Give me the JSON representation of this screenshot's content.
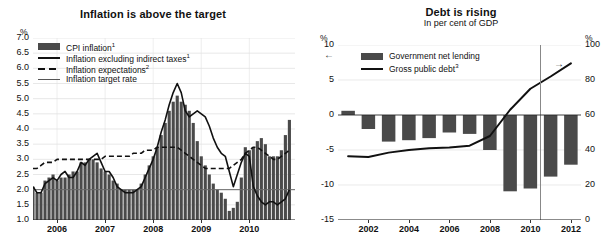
{
  "figure": {
    "background": "#ffffff",
    "bar_color": "#4a4a4a",
    "line_color": "#111111"
  },
  "left_panel": {
    "title": "Inflation is above the target",
    "y_unit": "%",
    "legend": [
      {
        "label": "CPI inflation",
        "sup": "1",
        "key": "swatch"
      },
      {
        "label": "Inflation excluding indirect taxes",
        "sup": "1",
        "key": "solid"
      },
      {
        "label": "Inflation expectations",
        "sup": "2",
        "key": "dash"
      },
      {
        "label": "Inflation target rate",
        "sup": "",
        "key": "thin"
      }
    ]
  },
  "right_panel": {
    "title": "Debt is rising",
    "subtitle": "In per cent of GDP",
    "y_unit_left": "%",
    "y_unit_right": "%",
    "arrow_left": "←",
    "arrow_right": "→",
    "legend": [
      {
        "label": "Government net lending",
        "sup": "",
        "key": "swatch"
      },
      {
        "label": "Gross public debt",
        "sup": "3",
        "key": "solid"
      }
    ]
  },
  "chart_data": [
    {
      "id": "inflation",
      "type": "bar",
      "title": "Inflation is above the target",
      "xlabel": "",
      "ylabel": "%",
      "ylim": [
        1.0,
        7.0
      ],
      "yticks": [
        "1.0",
        "1.5",
        "2.0",
        "2.5",
        "3.0",
        "3.5",
        "4.0",
        "4.5",
        "5.0",
        "5.5",
        "6.0",
        "6.5",
        "7.0"
      ],
      "xticks": [
        "2006",
        "2007",
        "2008",
        "2009",
        "2010"
      ],
      "xtick_positions": [
        2006.0,
        2007.0,
        2008.0,
        2009.0,
        2010.0
      ],
      "xlim": [
        2005.5,
        2010.95
      ],
      "grid": true,
      "legend_position": "top-left",
      "target_rate": 2.0,
      "categories": [
        "2005-07",
        "2005-08",
        "2005-09",
        "2005-10",
        "2005-11",
        "2005-12",
        "2006-01",
        "2006-02",
        "2006-03",
        "2006-04",
        "2006-05",
        "2006-06",
        "2006-07",
        "2006-08",
        "2006-09",
        "2006-10",
        "2006-11",
        "2006-12",
        "2007-01",
        "2007-02",
        "2007-03",
        "2007-04",
        "2007-05",
        "2007-06",
        "2007-07",
        "2007-08",
        "2007-09",
        "2007-10",
        "2007-11",
        "2007-12",
        "2008-01",
        "2008-02",
        "2008-03",
        "2008-04",
        "2008-05",
        "2008-06",
        "2008-07",
        "2008-08",
        "2008-09",
        "2008-10",
        "2008-11",
        "2008-12",
        "2009-01",
        "2009-02",
        "2009-03",
        "2009-04",
        "2009-05",
        "2009-06",
        "2009-07",
        "2009-08",
        "2009-09",
        "2009-10",
        "2009-11",
        "2009-12",
        "2010-01",
        "2010-02",
        "2010-03",
        "2010-04",
        "2010-05",
        "2010-06",
        "2010-07",
        "2010-08",
        "2010-09",
        "2010-10",
        "2010-11"
      ],
      "series": [
        {
          "name": "CPI inflation",
          "type": "bar",
          "values": [
            2.1,
            1.9,
            1.9,
            2.3,
            2.4,
            2.5,
            2.3,
            2.4,
            2.4,
            2.5,
            2.6,
            2.6,
            2.9,
            2.9,
            3.0,
            3.0,
            2.9,
            2.7,
            2.6,
            2.5,
            2.3,
            2.2,
            2.0,
            2.0,
            2.0,
            2.0,
            2.0,
            2.2,
            2.5,
            2.8,
            3.1,
            3.4,
            3.8,
            4.2,
            4.6,
            4.9,
            5.1,
            4.9,
            4.8,
            4.6,
            4.2,
            3.6,
            3.1,
            2.8,
            2.5,
            2.2,
            2.0,
            1.9,
            1.7,
            1.3,
            1.4,
            1.6,
            2.4,
            3.4,
            3.3,
            3.4,
            3.6,
            3.7,
            3.5,
            3.1,
            3.1,
            3.1,
            3.3,
            3.8,
            4.3
          ]
        },
        {
          "name": "Inflation excluding indirect taxes",
          "type": "line",
          "values": [
            2.1,
            1.9,
            1.9,
            2.2,
            2.3,
            2.4,
            2.3,
            2.5,
            2.6,
            2.4,
            2.4,
            2.6,
            2.9,
            2.8,
            3.0,
            3.1,
            3.2,
            2.9,
            2.6,
            2.6,
            2.4,
            2.1,
            2.0,
            1.9,
            1.9,
            1.9,
            2.0,
            2.1,
            2.4,
            2.7,
            3.0,
            3.4,
            3.9,
            4.3,
            4.8,
            5.2,
            5.5,
            5.2,
            4.6,
            4.4,
            4.5,
            4.6,
            4.5,
            4.4,
            4.1,
            3.7,
            3.4,
            3.2,
            3.1,
            2.6,
            2.1,
            2.5,
            2.9,
            3.2,
            3.1,
            2.1,
            1.8,
            1.6,
            1.5,
            1.6,
            1.6,
            1.5,
            1.6,
            1.7,
            2.0
          ]
        },
        {
          "name": "Inflation expectations",
          "type": "dashed-line",
          "values": [
            2.7,
            2.7,
            2.8,
            2.9,
            2.9,
            2.9,
            3.0,
            3.0,
            3.0,
            3.0,
            3.0,
            3.0,
            3.0,
            3.0,
            3.0,
            3.0,
            3.0,
            3.0,
            3.1,
            3.1,
            3.1,
            3.1,
            3.1,
            3.1,
            3.1,
            3.2,
            3.2,
            3.2,
            3.3,
            3.3,
            3.3,
            3.4,
            3.4,
            3.4,
            3.4,
            3.4,
            3.4,
            3.3,
            3.2,
            3.1,
            3.0,
            2.9,
            2.8,
            2.7,
            2.7,
            2.7,
            2.7,
            2.7,
            2.7,
            2.7,
            2.8,
            2.9,
            3.0,
            3.2,
            3.3,
            3.4,
            3.4,
            3.3,
            3.2,
            3.1,
            3.0,
            3.0,
            3.1,
            3.2,
            3.3
          ]
        }
      ]
    },
    {
      "id": "debt",
      "type": "bar",
      "title": "Debt is rising",
      "subtitle": "In per cent of GDP",
      "xlabel": "",
      "ylabel_left": "%",
      "ylabel_right": "%",
      "ylim_left": [
        -15,
        10
      ],
      "ylim_right": [
        0,
        100
      ],
      "yticks_left": [
        "10",
        "5",
        "0",
        "-5",
        "-10",
        "-15"
      ],
      "yticks_right": [
        "100",
        "80",
        "60",
        "40",
        "20",
        "0"
      ],
      "xticks": [
        "2002",
        "2004",
        "2006",
        "2008",
        "2010",
        "2012"
      ],
      "xlim": [
        2000.5,
        2012.5
      ],
      "grid": true,
      "legend_position": "top-center",
      "forecast_divider_x": 2010.5,
      "categories": [
        2001,
        2002,
        2003,
        2004,
        2005,
        2006,
        2007,
        2008,
        2009,
        2010,
        2011,
        2012
      ],
      "series": [
        {
          "name": "Government net lending",
          "type": "bar",
          "axis": "left",
          "values": [
            0.6,
            -2.0,
            -3.8,
            -3.6,
            -3.3,
            -2.5,
            -2.7,
            -5.0,
            -10.9,
            -10.5,
            -8.8,
            -7.1
          ]
        },
        {
          "name": "Gross public debt",
          "type": "line",
          "axis": "right",
          "values": [
            36.5,
            36.0,
            38.5,
            40.0,
            41.0,
            41.5,
            42.5,
            48.0,
            63.0,
            75.0,
            82.0,
            89.5
          ]
        }
      ]
    }
  ]
}
